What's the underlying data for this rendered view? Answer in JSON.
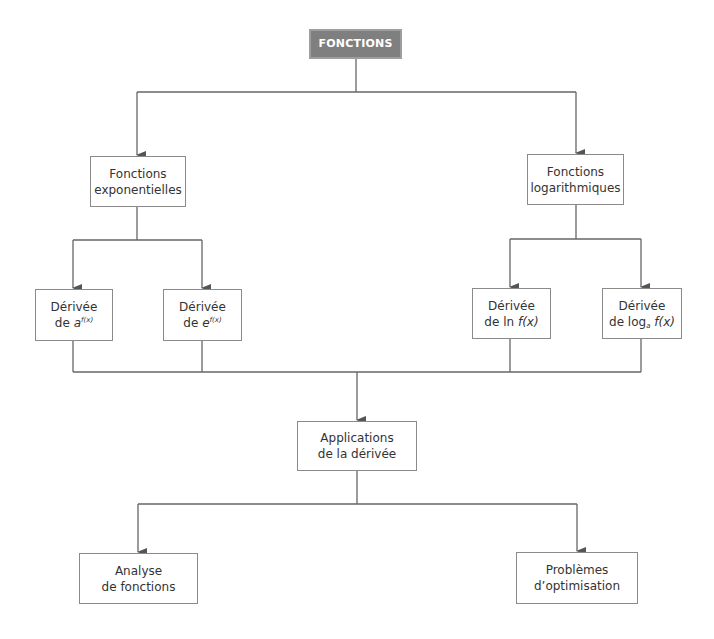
{
  "diagram": {
    "title": "FONCTIONS",
    "colors": {
      "root_fill": "#7f7f7f",
      "root_text": "#ffffff",
      "box_border": "#8a8a8a",
      "line": "#666666",
      "text": "#333333"
    },
    "level1": {
      "exponential": {
        "line1": "Fonctions",
        "line2": "exponentielles"
      },
      "logarithmic": {
        "line1": "Fonctions",
        "line2": "logarithmiques"
      }
    },
    "level2": {
      "deriv_a": {
        "line1": "Dérivée",
        "prefix": "de ",
        "base": "a",
        "exp": "f(x)"
      },
      "deriv_e": {
        "line1": "Dérivée",
        "prefix": "de ",
        "base": "e",
        "exp": "f(x)"
      },
      "deriv_ln": {
        "line1": "Dérivée",
        "prefix": "de ln ",
        "arg": "f(x)"
      },
      "deriv_log": {
        "line1": "Dérivée",
        "prefix": "de log",
        "sub": "a",
        "arg": " f(x)"
      }
    },
    "level3": {
      "applications": {
        "line1": "Applications",
        "line2": "de la dérivée"
      }
    },
    "level4": {
      "analyse": {
        "line1": "Analyse",
        "line2": "de fonctions"
      },
      "optimisation": {
        "line1": "Problèmes",
        "line2": "d’optimisation"
      }
    }
  }
}
